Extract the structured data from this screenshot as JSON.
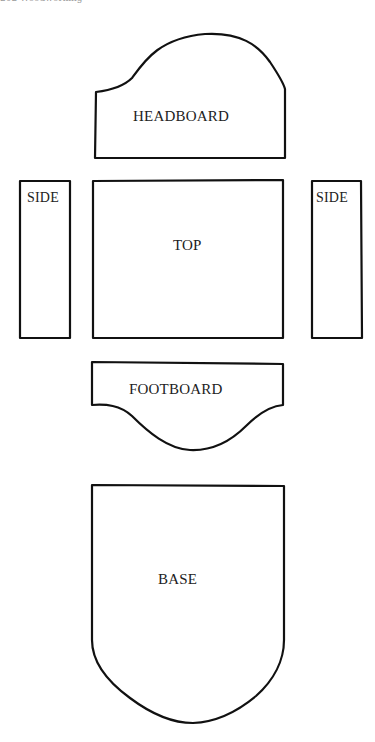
{
  "page_header": {
    "text": "202  Woodworking"
  },
  "diagram": {
    "pieces": {
      "headboard": {
        "label": "HEADBOARD"
      },
      "top": {
        "label": "TOP"
      },
      "side_left": {
        "label": "SIDE"
      },
      "side_right": {
        "label": "SIDE"
      },
      "footboard": {
        "label": "FOOTBOARD"
      },
      "base": {
        "label": "BASE"
      }
    },
    "stroke_color": "#111111",
    "background_color": "#ffffff"
  }
}
